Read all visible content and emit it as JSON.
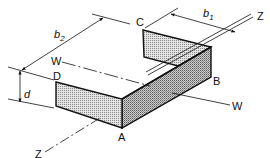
{
  "diagram": {
    "type": "isometric section view",
    "colors": {
      "line": "#111111",
      "face_fill": "#d6d6d6",
      "side_fill": "#bdbdbd",
      "background": "#ffffff"
    },
    "points": {
      "A": "A",
      "B": "B",
      "C": "C",
      "D": "D"
    },
    "axes": {
      "z_top": "Z",
      "z_bottom": "Z",
      "w_left": "W",
      "w_right": "W"
    },
    "dimensions": {
      "b1": {
        "symbol": "b",
        "subscript": "1"
      },
      "b2": {
        "symbol": "b",
        "subscript": "2"
      },
      "d": {
        "symbol": "d"
      }
    }
  }
}
